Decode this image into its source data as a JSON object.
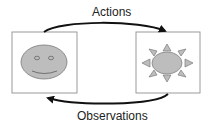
{
  "diagram": {
    "top_arrow": {
      "label": "Actions",
      "direction": "left-to-right"
    },
    "bottom_arrow": {
      "label": "Observations",
      "direction": "right-to-left"
    },
    "left_box": {
      "icon": "smiley-face-icon",
      "role": "agent"
    },
    "right_box": {
      "icon": "sun-icon",
      "role": "environment"
    },
    "colors": {
      "box_border": "#9a9a9a",
      "shape_fill": "#bdbdbd",
      "shape_stroke": "#7a7a7a",
      "arrow": "#111111"
    }
  }
}
